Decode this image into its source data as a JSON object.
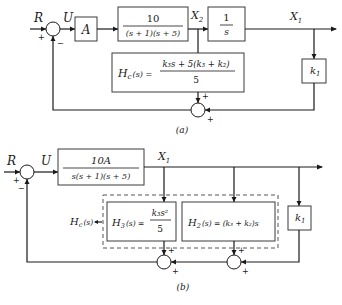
{
  "diagram_a": {
    "caption": "(a)",
    "signals": {
      "input": "R",
      "error": "U",
      "intermediate": "X",
      "intermediate_sub": "2",
      "output": "X",
      "output_sub": "1"
    },
    "summing_junction_1": {
      "plus": "+",
      "minus": "−"
    },
    "summing_junction_2": {
      "plus_top": "+",
      "plus_right": "+"
    },
    "blocks": {
      "amplifier": {
        "label": "A"
      },
      "plant": {
        "numerator": "10",
        "denominator": "(s + 1)(s + 5)"
      },
      "integrator": {
        "numerator": "1",
        "denominator": "s"
      },
      "compensator": {
        "lhs": "H",
        "lhs_sub": "c",
        "lhs_arg": "(s) =",
        "numerator": "k₃s + 5(k₃ + k₂)",
        "denominator": "5"
      },
      "gain": {
        "label": "k",
        "label_sub": "1"
      }
    }
  },
  "diagram_b": {
    "caption": "(b)",
    "signals": {
      "input": "R",
      "error": "U",
      "output": "X",
      "output_sub": "1"
    },
    "summing_junction_1": {
      "plus": "+",
      "minus": "−"
    },
    "summing_junction_2": {
      "plus_top": "+",
      "plus_bottom": "+"
    },
    "summing_junction_3": {
      "plus_top": "+",
      "plus_bottom": "+"
    },
    "hc_label": {
      "text": "H",
      "sub": "c",
      "arg": "(s)"
    },
    "blocks": {
      "forward": {
        "numerator": "10A",
        "denominator": "s(s + 1)(s + 5)"
      },
      "h3": {
        "lhs": "H",
        "lhs_sub": "3",
        "lhs_arg": "(s) =",
        "numerator": "k₃s²",
        "denominator": "5"
      },
      "h2": {
        "lhs": "H",
        "lhs_sub": "2",
        "lhs_arg": "(s) = (k₃ + k₂)s"
      },
      "gain": {
        "label": "k",
        "label_sub": "1"
      }
    }
  }
}
